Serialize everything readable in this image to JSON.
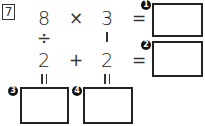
{
  "problem": {
    "number": "7",
    "row1": {
      "a": "8",
      "op": "×",
      "b": "3",
      "eq": "="
    },
    "vertical_ops": {
      "left": "÷",
      "right": "−"
    },
    "row2": {
      "a": "2",
      "op": "+",
      "b": "2",
      "eq": "="
    },
    "vertical_equals": {
      "left": "=",
      "right": "="
    },
    "answers": [
      {
        "label": "1",
        "value": ""
      },
      {
        "label": "2",
        "value": ""
      },
      {
        "label": "3",
        "value": ""
      },
      {
        "label": "4",
        "value": ""
      }
    ]
  }
}
